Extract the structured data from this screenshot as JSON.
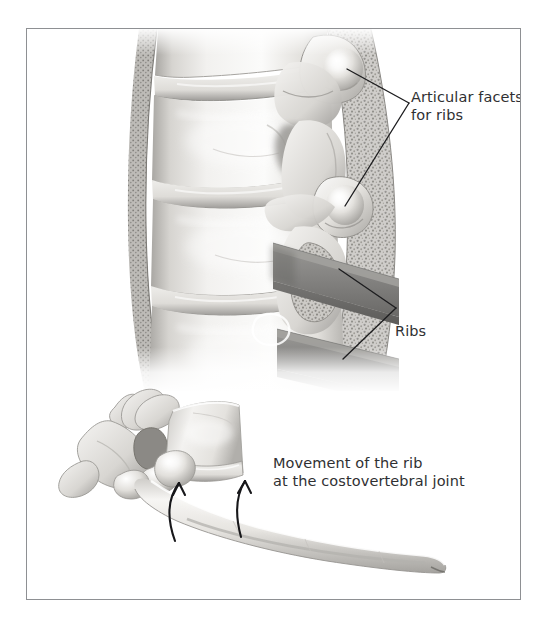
{
  "figure": {
    "kind": "anatomical-illustration",
    "frame": {
      "border_color": "#8e9093",
      "background": "#ffffff"
    },
    "text_color": "#2f3032",
    "panels": [
      {
        "id": "upper",
        "view": "lateral view of thoracic vertebrae with rib articulations",
        "elements": [
          "vertebral bodies",
          "intervertebral discs",
          "articular facets",
          "ribs"
        ]
      },
      {
        "id": "lower",
        "view": "oblique view of a single thoracic vertebra with attached rib",
        "elements": [
          "vertebra",
          "rib",
          "motion arrows"
        ]
      }
    ]
  },
  "labels": {
    "articular_facets": "Articular facets\nfor ribs",
    "ribs": "Ribs",
    "movement": "Movement of the rib\nat the costovertebral joint"
  },
  "caption_partial": "",
  "colors": {
    "bone_light": "#f4f3f1",
    "bone_mid": "#d9d7d3",
    "bone_shadow": "#9b9a97",
    "bone_deep": "#6f6e6c",
    "rib_slab": "#8a8986",
    "rib_slab_dark": "#6e6d6b",
    "cancellous": "#b5b3af",
    "leader_line": "#1d1d1f",
    "arrow": "#17171a"
  }
}
